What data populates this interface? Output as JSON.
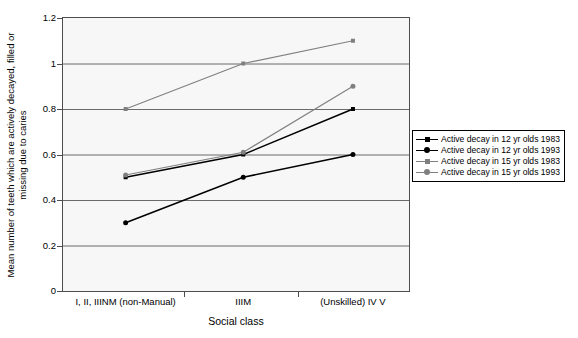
{
  "chart_data": {
    "type": "line",
    "title": "",
    "xlabel": "Social class",
    "ylabel_line1": "Mean number of teeth which are actively decayed, filled or",
    "ylabel_line2": "missing due to caries",
    "categories": [
      "I, II, IIINM (non-Manual)",
      "IIIM",
      "(Unskilled) IV V"
    ],
    "yticks": [
      "0",
      "0.2",
      "0.4",
      "0.6",
      "0.8",
      "1",
      "1.2"
    ],
    "ytick_values": [
      0,
      0.2,
      0.4,
      0.6,
      0.8,
      1,
      1.2
    ],
    "ylim": [
      0,
      1.2
    ],
    "grid": "horizontal",
    "legend_position": "right",
    "series": [
      {
        "name": "Active decay in 12 yr olds 1983",
        "values": [
          0.5,
          0.6,
          0.8
        ],
        "color": "#000000",
        "marker": "square",
        "marker_size": 4
      },
      {
        "name": "Active decay in 12 yr olds 1993",
        "values": [
          0.3,
          0.5,
          0.6
        ],
        "color": "#000000",
        "marker": "circle",
        "marker_size": 5
      },
      {
        "name": "Active decay in 15 yr olds 1983",
        "values": [
          0.8,
          1.0,
          1.1
        ],
        "color": "#808080",
        "marker": "square",
        "marker_size": 4
      },
      {
        "name": "Active decay in 15 yr olds 1993",
        "values": [
          0.51,
          0.61,
          0.9
        ],
        "color": "#808080",
        "marker": "circle",
        "marker_size": 5
      }
    ]
  }
}
